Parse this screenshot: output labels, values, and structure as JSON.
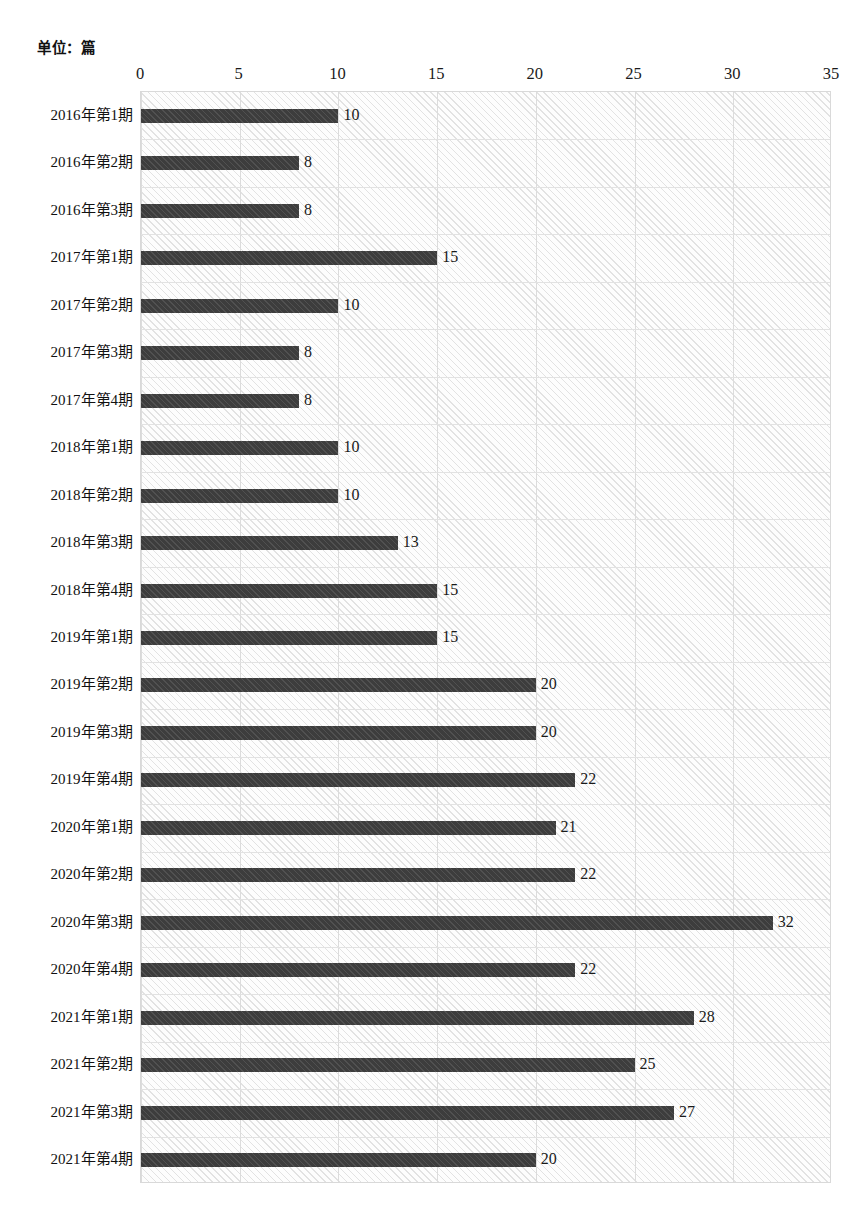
{
  "unit_caption": "单位：篇",
  "chart_data": {
    "type": "bar",
    "orientation": "horizontal",
    "title": "",
    "subtitle": "",
    "xlabel": "",
    "ylabel": "",
    "unit_note": "单位：篇",
    "xlim": [
      0,
      35
    ],
    "xticks": [
      0,
      5,
      10,
      15,
      20,
      25,
      30,
      35
    ],
    "xtick_labels": [
      "0",
      "5",
      "10",
      "15",
      "20",
      "25",
      "30",
      "35"
    ],
    "grid": true,
    "legend": null,
    "bar_color": "#3d3d3d",
    "plot_background": "#fdfdfd",
    "gridline_color": "#dcdcdc",
    "show_data_labels": true,
    "categories": [
      "2016年第1期",
      "2016年第2期",
      "2016年第3期",
      "2017年第1期",
      "2017年第2期",
      "2017年第3期",
      "2017年第4期",
      "2018年第1期",
      "2018年第2期",
      "2018年第3期",
      "2018年第4期",
      "2019年第1期",
      "2019年第2期",
      "2019年第3期",
      "2019年第4期",
      "2020年第1期",
      "2020年第2期",
      "2020年第3期",
      "2020年第4期",
      "2021年第1期",
      "2021年第2期",
      "2021年第3期",
      "2021年第4期"
    ],
    "values": [
      10,
      8,
      8,
      15,
      10,
      8,
      8,
      10,
      10,
      13,
      15,
      15,
      20,
      20,
      22,
      21,
      22,
      32,
      22,
      28,
      25,
      27,
      20
    ],
    "value_labels": [
      "10",
      "8",
      "8",
      "15",
      "10",
      "8",
      "8",
      "10",
      "10",
      "13",
      "15",
      "15",
      "20",
      "20",
      "22",
      "21",
      "22",
      "32",
      "22",
      "28",
      "25",
      "27",
      "20"
    ]
  }
}
